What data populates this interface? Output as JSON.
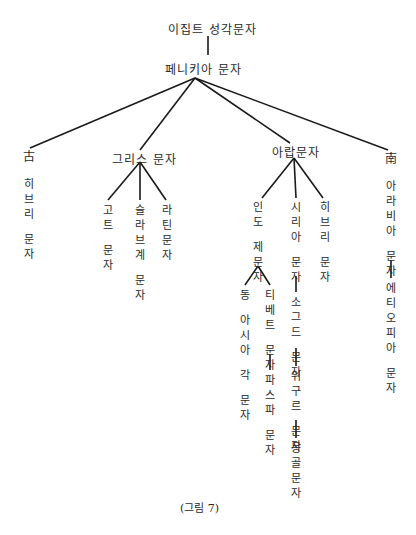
{
  "diagram": {
    "root": "이집트 성각문자",
    "level1": "페니키아 문자",
    "branches": {
      "old_hebrew": {
        "prefix": "古",
        "label": "히브리 문자"
      },
      "greek": {
        "label": "그리스 문자",
        "children": [
          "고트 문자",
          "슬라브계 문자",
          "라틴문자"
        ]
      },
      "arabic": {
        "label": "아랍문자",
        "children": {
          "indic": {
            "label": "인도 제문자",
            "children": [
              "동 아시아 각 문자",
              "티베트 문자"
            ],
            "tibetan_child": "파스파 문자"
          },
          "syriac": {
            "label": "시리아 문자",
            "chain": [
              "소그드 문자",
              "위구르 문자",
              "몽골문자"
            ]
          },
          "hebrew": {
            "label": "히브리 문자"
          }
        }
      },
      "south_arabian": {
        "prefix": "南",
        "label": "아라비아 문자",
        "child": "에티오피아 문자"
      }
    },
    "caption": "(그림 7)"
  }
}
